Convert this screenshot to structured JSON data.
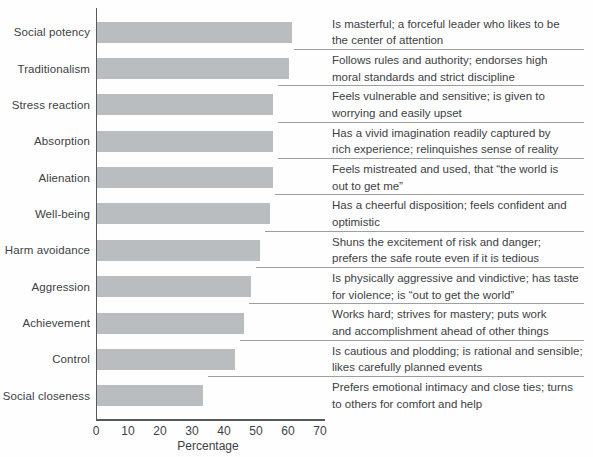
{
  "figure": {
    "background": "#fefefe",
    "bar_color": "#b9bdbf",
    "text_color": "#3d4145",
    "separator_color": "#9da0a2",
    "axis_color": "#55595c"
  },
  "chart_data": {
    "type": "bar",
    "orientation": "horizontal",
    "title": "",
    "xlabel": "Percentage",
    "ylabel": "",
    "xlim": [
      0,
      70
    ],
    "xticks": [
      "0",
      "10",
      "20",
      "30",
      "40",
      "50",
      "60",
      "70"
    ],
    "grid": false,
    "legend": false,
    "categories": [
      "Social potency",
      "Traditionalism",
      "Stress reaction",
      "Absorption",
      "Alienation",
      "Well-being",
      "Harm avoidance",
      "Aggression",
      "Achievement",
      "Control",
      "Social closeness"
    ],
    "values": [
      61,
      60,
      55,
      55,
      55,
      54,
      51,
      48,
      46,
      43,
      33
    ],
    "descriptions": [
      [
        "Is masterful; a forceful leader who likes to be",
        "the center of attention"
      ],
      [
        "Follows rules and authority; endorses high",
        "moral standards and strict discipline"
      ],
      [
        "Feels vulnerable and sensitive; is given to",
        "worrying and easily upset"
      ],
      [
        "Has a vivid imagination readily captured by",
        "rich experience; relinquishes sense of reality"
      ],
      [
        "Feels mistreated and used, that “the world is",
        "out to get me”"
      ],
      [
        "Has a cheerful disposition; feels confident and",
        "optimistic"
      ],
      [
        "Shuns the excitement of risk and danger;",
        "prefers the safe route even if it is tedious"
      ],
      [
        "Is physically aggressive and vindictive; has taste",
        "for violence; is “out to get the world”"
      ],
      [
        "Works hard; strives for mastery; puts work",
        "and accomplishment ahead of other things"
      ],
      [
        "Is cautious and plodding; is rational and sensible;",
        "likes carefully planned events"
      ],
      [
        "Prefers emotional intimacy and close ties; turns",
        "to others for comfort and help"
      ]
    ]
  }
}
